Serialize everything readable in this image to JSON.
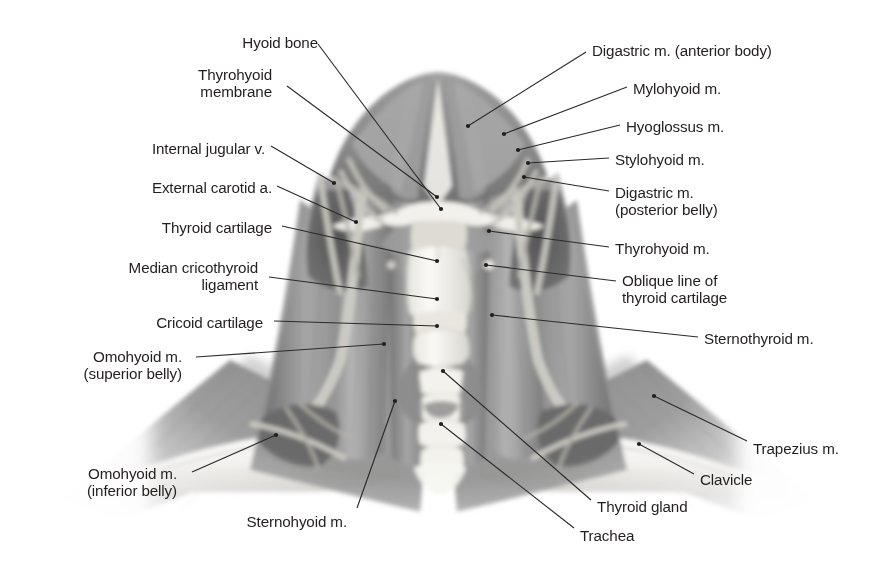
{
  "figure": {
    "illustration_style": "grayscale airbrush anatomical drawing",
    "frame_color": "#f2f2f2",
    "text_color": "#231f20",
    "leader_color": "#2b2b2b",
    "background_color": "#ffffff"
  },
  "labels": [
    {
      "id": "hyoid-bone",
      "text": "Hyoid bone",
      "side": "left",
      "x": 318,
      "y": 34,
      "align": "right",
      "lines": [
        "Hyoid bone"
      ]
    },
    {
      "id": "thyrohyoid-membrane",
      "text": "Thyrohyoid membrane",
      "side": "left",
      "x": 272,
      "y": 66,
      "align": "right",
      "lines": [
        "Thyrohyoid",
        "membrane"
      ]
    },
    {
      "id": "internal-jugular-v",
      "text": "Internal jugular v.",
      "side": "left",
      "x": 265,
      "y": 140,
      "align": "right",
      "lines": [
        "Internal jugular v."
      ]
    },
    {
      "id": "external-carotid-a",
      "text": "External carotid a.",
      "side": "left",
      "x": 272,
      "y": 179,
      "align": "right",
      "lines": [
        "External carotid a."
      ]
    },
    {
      "id": "thyroid-cartilage",
      "text": "Thyroid cartilage",
      "side": "left",
      "x": 272,
      "y": 219,
      "align": "right",
      "lines": [
        "Thyroid cartilage"
      ]
    },
    {
      "id": "median-cricothyroid-ligament",
      "text": "Median cricothyroid ligament",
      "side": "left",
      "x": 258,
      "y": 259,
      "align": "right",
      "lines": [
        "Median cricothyroid",
        "ligament"
      ]
    },
    {
      "id": "cricoid-cartilage",
      "text": "Cricoid cartilage",
      "side": "left",
      "x": 263,
      "y": 314,
      "align": "right",
      "lines": [
        "Cricoid cartilage"
      ]
    },
    {
      "id": "omohyoid-superior-belly",
      "text": "Omohyoid m. (superior belly)",
      "side": "left",
      "x": 182,
      "y": 348,
      "align": "right",
      "lines": [
        "Omohyoid m.",
        "(superior belly)"
      ]
    },
    {
      "id": "omohyoid-inferior-belly",
      "text": "Omohyoid m. (inferior belly)",
      "side": "left",
      "x": 177,
      "y": 465,
      "align": "right",
      "lines": [
        "Omohyoid m.",
        "(inferior belly)"
      ]
    },
    {
      "id": "sternohyoid-m",
      "text": "Sternohyoid m.",
      "side": "left",
      "x": 347,
      "y": 513,
      "align": "right",
      "lines": [
        "Sternohyoid m."
      ]
    },
    {
      "id": "digastric-anterior-body",
      "text": "Digastric m. (anterior body)",
      "side": "right",
      "x": 592,
      "y": 42,
      "align": "left",
      "lines": [
        "Digastric m. (anterior body)"
      ]
    },
    {
      "id": "mylohyoid-m",
      "text": "Mylohyoid m.",
      "side": "right",
      "x": 633,
      "y": 80,
      "align": "left",
      "lines": [
        "Mylohyoid m."
      ]
    },
    {
      "id": "hyoglossus-m",
      "text": "Hyoglossus m.",
      "side": "right",
      "x": 626,
      "y": 118,
      "align": "left",
      "lines": [
        "Hyoglossus m."
      ]
    },
    {
      "id": "stylohyoid-m",
      "text": "Stylohyoid m.",
      "side": "right",
      "x": 615,
      "y": 151,
      "align": "left",
      "lines": [
        "Stylohyoid m."
      ]
    },
    {
      "id": "digastric-posterior-belly",
      "text": "Digastric m. (posterior belly)",
      "side": "right",
      "x": 615,
      "y": 184,
      "align": "left",
      "lines": [
        "Digastric m.",
        "(posterior belly)"
      ]
    },
    {
      "id": "thyrohyoid-m",
      "text": "Thyrohyoid m.",
      "side": "right",
      "x": 615,
      "y": 240,
      "align": "left",
      "lines": [
        "Thyrohyoid m."
      ]
    },
    {
      "id": "oblique-line-thyroid-cartilage",
      "text": "Oblique line of thyroid cartilage",
      "side": "right",
      "x": 622,
      "y": 272,
      "align": "left",
      "lines": [
        "Oblique line of",
        "thyroid cartilage"
      ]
    },
    {
      "id": "sternothyroid-m",
      "text": "Sternothyroid m.",
      "side": "right",
      "x": 704,
      "y": 330,
      "align": "left",
      "lines": [
        "Sternothyroid m."
      ]
    },
    {
      "id": "trapezius-m",
      "text": "Trapezius m.",
      "side": "right",
      "x": 753,
      "y": 440,
      "align": "left",
      "lines": [
        "Trapezius m."
      ]
    },
    {
      "id": "clavicle",
      "text": "Clavicle",
      "side": "right",
      "x": 700,
      "y": 471,
      "align": "left",
      "lines": [
        "Clavicle"
      ]
    },
    {
      "id": "thyroid-gland",
      "text": "Thyroid gland",
      "side": "right",
      "x": 597,
      "y": 498,
      "align": "left",
      "lines": [
        "Thyroid gland"
      ]
    },
    {
      "id": "trachea",
      "text": "Trachea",
      "side": "right",
      "x": 580,
      "y": 527,
      "align": "left",
      "lines": [
        "Trachea"
      ]
    }
  ],
  "leaders": [
    {
      "id": "leader-hyoid-bone",
      "points": "318,44 441,209",
      "dot": "441,209"
    },
    {
      "id": "leader-thyrohyoid-membrane",
      "points": "287,86 437,197",
      "dot": "437,197"
    },
    {
      "id": "leader-internal-jugular-v",
      "points": "271,146 334,183",
      "dot": "334,183"
    },
    {
      "id": "leader-external-carotid-a",
      "points": "277,186 356,222",
      "dot": "356,222"
    },
    {
      "id": "leader-thyroid-cartilage",
      "points": "282,226 437,261",
      "dot": "437,261"
    },
    {
      "id": "leader-median-cricothyroid",
      "points": "269,277 437,299",
      "dot": "437,299"
    },
    {
      "id": "leader-cricoid-cartilage",
      "points": "274,321 437,326",
      "dot": "437,326"
    },
    {
      "id": "leader-omohyoid-superior",
      "points": "196,357 384,344",
      "dot": "384,344"
    },
    {
      "id": "leader-omohyoid-inferior",
      "points": "192,472 276,435",
      "dot": "276,435"
    },
    {
      "id": "leader-sternohyoid-m",
      "points": "357,508 395,401",
      "dot": "395,401"
    },
    {
      "id": "leader-digastric-anterior",
      "points": "586,52 468,126",
      "dot": "468,126"
    },
    {
      "id": "leader-mylohyoid-m",
      "points": "627,87 504,134",
      "dot": "504,134"
    },
    {
      "id": "leader-hyoglossus-m",
      "points": "620,125 518,150",
      "dot": "518,150"
    },
    {
      "id": "leader-stylohyoid-m",
      "points": "609,158 528,163",
      "dot": "528,163"
    },
    {
      "id": "leader-digastric-posterior",
      "points": "609,191 524,177",
      "dot": "524,177"
    },
    {
      "id": "leader-thyrohyoid-m",
      "points": "609,247 489,231",
      "dot": "489,231"
    },
    {
      "id": "leader-oblique-line",
      "points": "616,281 486,265",
      "dot": "486,265"
    },
    {
      "id": "leader-sternothyroid-m",
      "points": "698,337 492,315",
      "dot": "492,315"
    },
    {
      "id": "leader-trapezius-m",
      "points": "747,441 654,396",
      "dot": "654,396"
    },
    {
      "id": "leader-clavicle",
      "points": "694,474 639,444",
      "dot": "639,444"
    },
    {
      "id": "leader-thyroid-gland",
      "points": "591,500 443,371",
      "dot": "443,371"
    },
    {
      "id": "leader-trachea",
      "points": "574,528 441,424",
      "dot": "441,424"
    }
  ]
}
